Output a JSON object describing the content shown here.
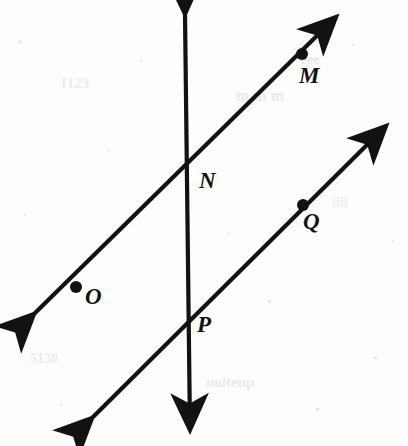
{
  "figure": {
    "kind": "geometry-diagram",
    "background_color": "#fdfdfc",
    "ink_color": "#121212",
    "bleed_color": "#d9d9d6",
    "width": 408,
    "height": 446,
    "lines": [
      {
        "id": "line-upper",
        "name": "upper-parallel-line",
        "x1": 34,
        "y1": 314,
        "x2": 336,
        "y2": 17,
        "stroke_width": 4.2,
        "arrow_start": true,
        "arrow_end": true
      },
      {
        "id": "line-lower",
        "name": "lower-parallel-line",
        "x1": 92,
        "y1": 418,
        "x2": 386,
        "y2": 126,
        "stroke_width": 4.2,
        "arrow_start": true,
        "arrow_end": true
      },
      {
        "id": "line-transversal",
        "name": "vertical-transversal-line",
        "x1": 185,
        "y1": 14,
        "x2": 190,
        "y2": 430,
        "stroke_width": 4.2,
        "arrow_start": true,
        "arrow_end": true
      }
    ],
    "points": [
      {
        "id": "point-m",
        "label": "M",
        "dot": true,
        "dot_x": 302,
        "dot_y": 54,
        "dot_r": 6.0,
        "label_x": 299,
        "label_y": 64
      },
      {
        "id": "point-n",
        "label": "N",
        "dot": false,
        "dot_x": 190,
        "dot_y": 178,
        "dot_r": 0,
        "label_x": 199,
        "label_y": 169
      },
      {
        "id": "point-o",
        "label": "O",
        "dot": true,
        "dot_x": 76,
        "dot_y": 287,
        "dot_r": 6.0,
        "label_x": 85,
        "label_y": 285
      },
      {
        "id": "point-p",
        "label": "P",
        "dot": false,
        "dot_x": 188,
        "dot_y": 322,
        "dot_r": 0,
        "label_x": 197,
        "label_y": 313
      },
      {
        "id": "point-q",
        "label": "Q",
        "dot": true,
        "dot_x": 303,
        "dot_y": 205,
        "dot_r": 6.0,
        "label_x": 303,
        "label_y": 210
      }
    ],
    "label_font_size": 23,
    "bleed_marks": [
      {
        "text": "eee",
        "x": 300,
        "y": 52,
        "size": 15,
        "rotate": 0,
        "opacity": 0.55
      },
      {
        "text": "m m m",
        "x": 236,
        "y": 88,
        "size": 16,
        "rotate": 0,
        "opacity": 0.5
      },
      {
        "text": "1123",
        "x": 60,
        "y": 76,
        "size": 15,
        "rotate": 0,
        "opacity": 0.45
      },
      {
        "text": "noiteup",
        "x": 206,
        "y": 375,
        "size": 15,
        "rotate": 0,
        "opacity": 0.5
      },
      {
        "text": "5130",
        "x": 30,
        "y": 352,
        "size": 14,
        "rotate": 0,
        "opacity": 0.45
      },
      {
        "text": "iiii",
        "x": 332,
        "y": 196,
        "size": 14,
        "rotate": 0,
        "opacity": 0.4
      }
    ]
  }
}
